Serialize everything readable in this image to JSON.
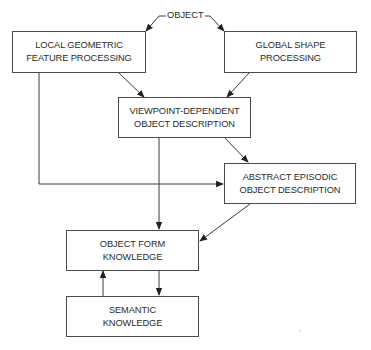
{
  "diagram": {
    "type": "flowchart",
    "input_label": "OBJECT",
    "nodes": [
      {
        "id": "local",
        "lines": [
          "LOCAL GEOMETRIC",
          "FEATURE PROCESSING"
        ]
      },
      {
        "id": "global",
        "lines": [
          "GLOBAL SHAPE",
          "PROCESSING"
        ]
      },
      {
        "id": "viewpoint",
        "lines": [
          "VIEWPOINT-DEPENDENT",
          "OBJECT DESCRIPTION"
        ]
      },
      {
        "id": "abstract",
        "lines": [
          "ABSTRACT EPISODIC",
          "OBJECT DESCRIPTION"
        ]
      },
      {
        "id": "form",
        "lines": [
          "OBJECT FORM",
          "KNOWLEDGE"
        ]
      },
      {
        "id": "semantic",
        "lines": [
          "SEMANTIC",
          "KNOWLEDGE"
        ]
      }
    ],
    "edges": [
      {
        "from": "OBJECT",
        "to": "local"
      },
      {
        "from": "OBJECT",
        "to": "global"
      },
      {
        "from": "local",
        "to": "viewpoint"
      },
      {
        "from": "global",
        "to": "viewpoint"
      },
      {
        "from": "viewpoint",
        "to": "abstract"
      },
      {
        "from": "local",
        "to": "abstract"
      },
      {
        "from": "viewpoint",
        "to": "form"
      },
      {
        "from": "abstract",
        "to": "form"
      },
      {
        "from": "form",
        "to": "semantic"
      },
      {
        "from": "semantic",
        "to": "form"
      }
    ],
    "line_color": "#3a3a3a"
  }
}
